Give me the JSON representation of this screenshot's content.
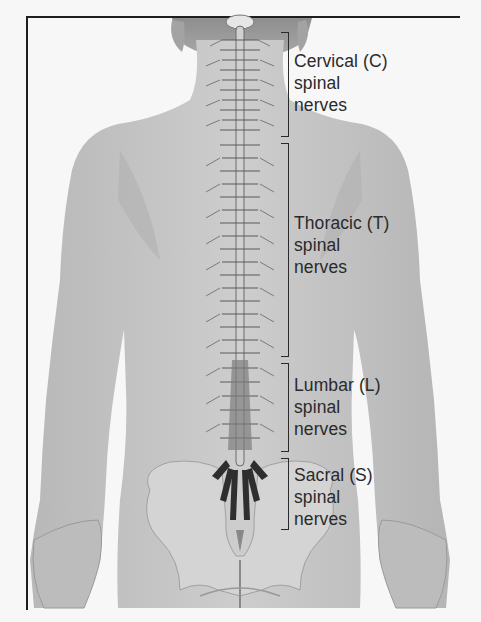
{
  "figure": {
    "colors": {
      "background": "#f7f7f7",
      "skin": "#c4c4c4",
      "skin_shadow": "#a9a9a9",
      "bone": "#dcdcdc",
      "frame": "#1e1e1e",
      "text": "#2a2a2a"
    }
  },
  "labels": [
    {
      "id": "cervical",
      "lines": [
        "Cervical (C)",
        "spinal",
        "nerves"
      ]
    },
    {
      "id": "thoracic",
      "lines": [
        "Thoracic (T)",
        "spinal",
        "nerves"
      ]
    },
    {
      "id": "lumbar",
      "lines": [
        "Lumbar (L)",
        "spinal",
        "nerves"
      ]
    },
    {
      "id": "sacral",
      "lines": [
        "Sacral (S)",
        "spinal",
        "nerves"
      ]
    }
  ]
}
